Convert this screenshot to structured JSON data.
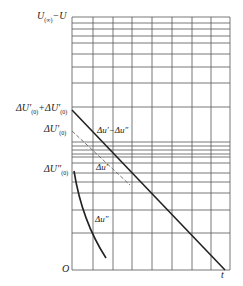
{
  "diagram": {
    "type": "semilog plot",
    "y_axis_title": "U(∞)−U",
    "x_axis_label": "t",
    "origin_label": "O",
    "y_ticks": [
      {
        "id": "sum",
        "label": "ΔU′(0)+ΔU″(0)",
        "y": 110
      },
      {
        "id": "prime",
        "label": "ΔU′(0)",
        "y": 131
      },
      {
        "id": "dprime",
        "label": "ΔU″(0)",
        "y": 171
      }
    ],
    "curves": [
      {
        "name": "Δu′−Δu″",
        "style": "solid",
        "from": [
          72,
          110
        ],
        "to": [
          225,
          270
        ]
      },
      {
        "name": "Δu′",
        "style": "dashed",
        "from": [
          72,
          131
        ],
        "to": [
          130,
          185
        ]
      },
      {
        "name": "Δu″",
        "style": "solid",
        "from": [
          74,
          171
        ],
        "to": [
          106,
          258
        ]
      }
    ],
    "curve_labels": {
      "diff": "Δu′−Δu″",
      "prime": "Δu′",
      "dprime": "Δu″"
    },
    "grid": {
      "x_lines": [
        72,
        93,
        113,
        132,
        152,
        172,
        192,
        211,
        230
      ],
      "y_lines": [
        17,
        23,
        29,
        36,
        43,
        54,
        67,
        83,
        107,
        142,
        146,
        150,
        154,
        157,
        163,
        173,
        182,
        193,
        210,
        233,
        270
      ],
      "color": "#555555"
    },
    "colors": {
      "line": "#222222",
      "grid": "#555555",
      "dashed": "#666666"
    }
  }
}
